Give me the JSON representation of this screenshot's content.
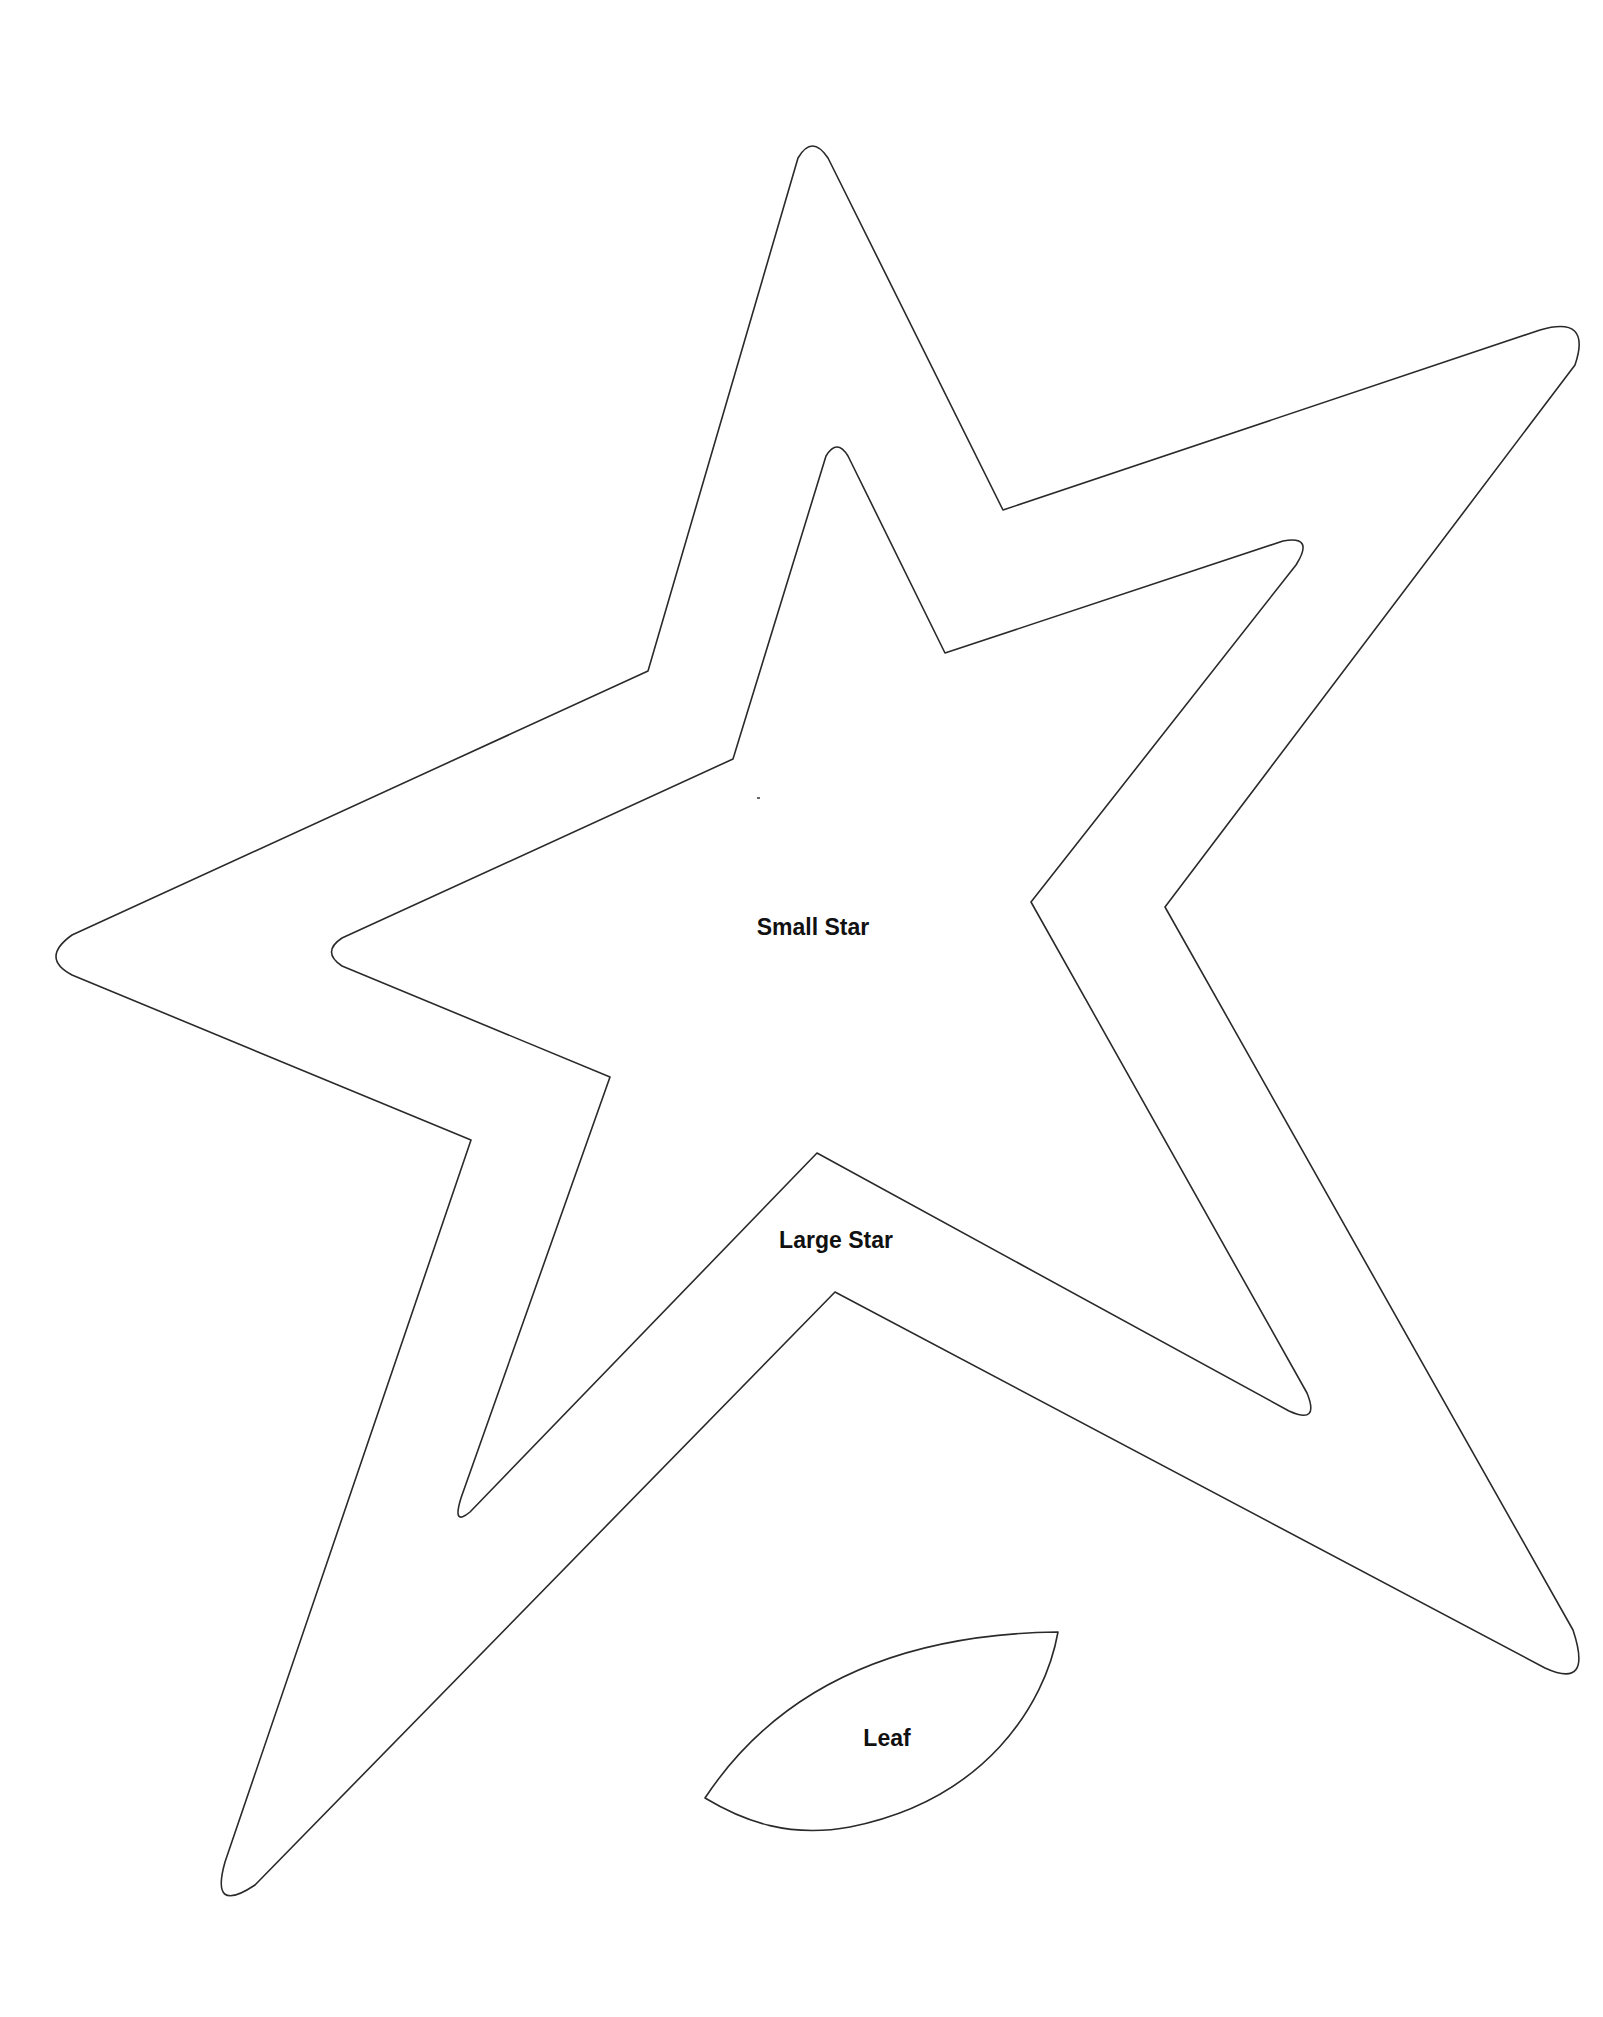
{
  "page": {
    "background": "#ffffff",
    "stroke_color": "#2a2a2a"
  },
  "shapes": {
    "large_star": {
      "label": "Large Star",
      "label_pos": [
        836,
        1240
      ]
    },
    "small_star": {
      "label": "Small Star",
      "label_pos": [
        813,
        927
      ]
    },
    "leaf": {
      "label": "Leaf",
      "label_pos": [
        887,
        1738
      ]
    }
  }
}
